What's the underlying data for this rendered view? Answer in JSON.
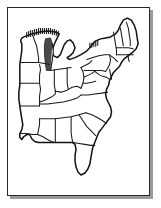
{
  "image": {
    "title": "Outline map of the eastern United States",
    "kind": "line-art map",
    "width": 161,
    "height": 208,
    "background_color": "#ffffff"
  },
  "frame": {
    "name": "map-frame",
    "border_color": "#2b2b2b",
    "shadow_color": "#9a9a9a",
    "fill_color": "#ffffff"
  },
  "map": {
    "region_label": "Eastern United States",
    "projection_note": "simplified outline",
    "outline_color": "#111111",
    "border_color": "#1a1a1a",
    "shade_color": "#4a4a4a",
    "states": [
      {
        "code": "MN",
        "name": "Minnesota"
      },
      {
        "code": "WI",
        "name": "Wisconsin"
      },
      {
        "code": "MI",
        "name": "Michigan"
      },
      {
        "code": "IA",
        "name": "Iowa"
      },
      {
        "code": "IL",
        "name": "Illinois"
      },
      {
        "code": "IN",
        "name": "Indiana"
      },
      {
        "code": "OH",
        "name": "Ohio"
      },
      {
        "code": "MO",
        "name": "Missouri"
      },
      {
        "code": "KY",
        "name": "Kentucky"
      },
      {
        "code": "WV",
        "name": "West Virginia"
      },
      {
        "code": "VA",
        "name": "Virginia"
      },
      {
        "code": "PA",
        "name": "Pennsylvania"
      },
      {
        "code": "NY",
        "name": "New York"
      },
      {
        "code": "VT",
        "name": "Vermont"
      },
      {
        "code": "NH",
        "name": "New Hampshire"
      },
      {
        "code": "ME",
        "name": "Maine"
      },
      {
        "code": "MA",
        "name": "Massachusetts"
      },
      {
        "code": "CT",
        "name": "Connecticut"
      },
      {
        "code": "RI",
        "name": "Rhode Island"
      },
      {
        "code": "NJ",
        "name": "New Jersey"
      },
      {
        "code": "DE",
        "name": "Delaware"
      },
      {
        "code": "MD",
        "name": "Maryland"
      },
      {
        "code": "NC",
        "name": "North Carolina"
      },
      {
        "code": "SC",
        "name": "South Carolina"
      },
      {
        "code": "TN",
        "name": "Tennessee"
      },
      {
        "code": "AR",
        "name": "Arkansas"
      },
      {
        "code": "LA",
        "name": "Louisiana"
      },
      {
        "code": "MS",
        "name": "Mississippi"
      },
      {
        "code": "AL",
        "name": "Alabama"
      },
      {
        "code": "GA",
        "name": "Georgia"
      },
      {
        "code": "FL",
        "name": "Florida"
      }
    ],
    "shaded_features": [
      {
        "name": "Lake Superior shoreline hatching"
      },
      {
        "name": "Lake Michigan shaded band"
      },
      {
        "name": "Lake Erie shoreline hatching"
      }
    ]
  }
}
